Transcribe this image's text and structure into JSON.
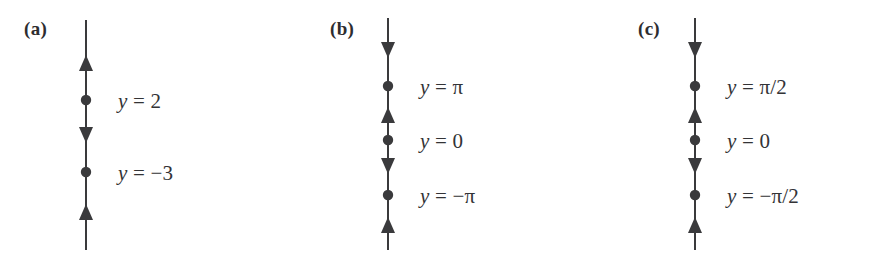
{
  "figure": {
    "width": 870,
    "height": 257,
    "background_color": "#ffffff",
    "stroke_color": "#3a3a3c",
    "text_color": "#333336"
  },
  "panels": [
    {
      "tag": "(a)",
      "tag_x": 24,
      "tag_y": 18,
      "axis_x": 86,
      "axis_top": 20,
      "axis_bottom": 250,
      "label_x": 118,
      "equilibria": [
        {
          "label_parts": {
            "var": "y",
            "op": "=",
            "value": "2"
          },
          "label_text": "y = 2",
          "y": 100,
          "label_y": 89
        },
        {
          "label_parts": {
            "var": "y",
            "op": "=",
            "value": "−3"
          },
          "label_text": "y = −3",
          "y": 172,
          "label_y": 161
        }
      ],
      "arrows": [
        {
          "direction": "up",
          "y": 63
        },
        {
          "direction": "down",
          "y": 135
        },
        {
          "direction": "up",
          "y": 212
        }
      ]
    },
    {
      "tag": "(b)",
      "tag_x": 330,
      "tag_y": 18,
      "axis_x": 388,
      "axis_top": 18,
      "axis_bottom": 250,
      "label_x": 420,
      "equilibria": [
        {
          "label_parts": {
            "var": "y",
            "op": "=",
            "value": "π"
          },
          "label_text": "y = π",
          "y": 86,
          "label_y": 75
        },
        {
          "label_parts": {
            "var": "y",
            "op": "=",
            "value": "0"
          },
          "label_text": "y = 0",
          "y": 140,
          "label_y": 129
        },
        {
          "label_parts": {
            "var": "y",
            "op": "=",
            "value": "−π"
          },
          "label_text": "y = −π",
          "y": 195,
          "label_y": 184
        }
      ],
      "arrows": [
        {
          "direction": "down",
          "y": 50
        },
        {
          "direction": "up",
          "y": 115
        },
        {
          "direction": "down",
          "y": 166
        },
        {
          "direction": "up",
          "y": 225
        }
      ]
    },
    {
      "tag": "(c)",
      "tag_x": 638,
      "tag_y": 18,
      "axis_x": 695,
      "axis_top": 18,
      "axis_bottom": 250,
      "label_x": 727,
      "equilibria": [
        {
          "label_parts": {
            "var": "y",
            "op": "=",
            "value": "π/2"
          },
          "label_text": "y = π/2",
          "y": 86,
          "label_y": 75
        },
        {
          "label_parts": {
            "var": "y",
            "op": "=",
            "value": "0"
          },
          "label_text": "y = 0",
          "y": 140,
          "label_y": 129
        },
        {
          "label_parts": {
            "var": "y",
            "op": "=",
            "value": "−π/2"
          },
          "label_text": "y = −π/2",
          "y": 195,
          "label_y": 184
        }
      ],
      "arrows": [
        {
          "direction": "down",
          "y": 50
        },
        {
          "direction": "up",
          "y": 115
        },
        {
          "direction": "down",
          "y": 166
        },
        {
          "direction": "up",
          "y": 225
        }
      ]
    }
  ]
}
